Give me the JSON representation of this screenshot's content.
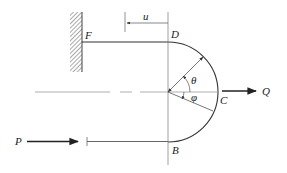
{
  "diagram": {
    "labels": {
      "F": "F",
      "D": "D",
      "C": "C",
      "B": "B",
      "P": "P",
      "Q": "Q",
      "u": "u",
      "theta": "θ",
      "phi": "φ"
    },
    "colors": {
      "line": "#333333",
      "thin_line": "#777777",
      "hatch": "#555555",
      "background": "#ffffff"
    }
  }
}
